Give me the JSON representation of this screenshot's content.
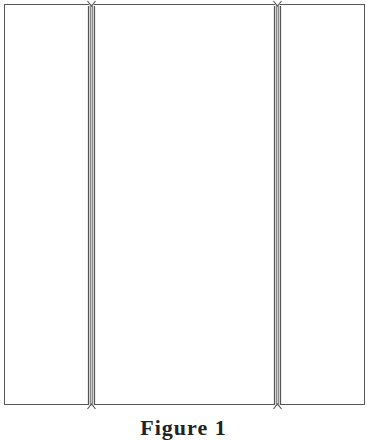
{
  "figure": {
    "panels": [
      {
        "label": ""
      },
      {
        "label": ""
      },
      {
        "label": ""
      }
    ],
    "dividers": [
      {
        "name": "left-divider"
      },
      {
        "name": "right-divider"
      }
    ],
    "caption": "Figure 1"
  },
  "colors": {
    "stroke": "#555555",
    "rail_fill": "#d9d9d9",
    "background": "#ffffff"
  }
}
